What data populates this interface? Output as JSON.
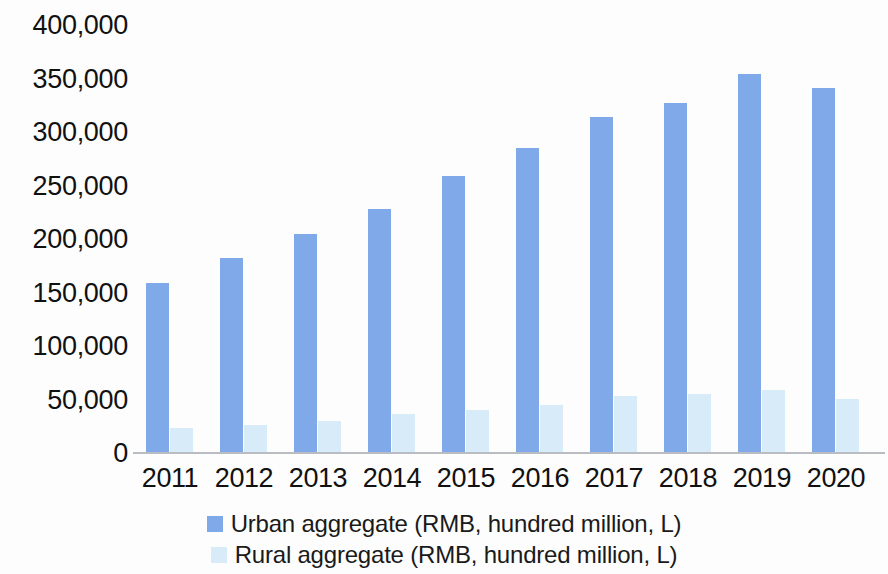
{
  "chart_data": {
    "type": "bar",
    "title": "",
    "subtitle": "",
    "xlabel": "",
    "ylabel": "",
    "categories": [
      "2011",
      "2012",
      "2013",
      "2014",
      "2015",
      "2016",
      "2017",
      "2018",
      "2019",
      "2020"
    ],
    "series": [
      {
        "name": "Urban aggregate (RMB, hundred million, L)",
        "color": "#7fa9e8",
        "values": [
          160000,
          183000,
          206000,
          229000,
          260000,
          286000,
          315000,
          328000,
          355000,
          342000
        ]
      },
      {
        "name": "Rural aggregate (RMB, hundred million, L)",
        "color": "#d8ebf8",
        "values": [
          24000,
          27000,
          31000,
          37000,
          41000,
          46000,
          54000,
          56000,
          60000,
          51000
        ]
      }
    ],
    "ylim": [
      0,
      400000
    ],
    "ytick_labels": [
      "400,000",
      "350,000",
      "300,000",
      "250,000",
      "200,000",
      "150,000",
      "100,000",
      "50,000",
      "0"
    ],
    "ytick_values": [
      400000,
      350000,
      300000,
      250000,
      200000,
      150000,
      100000,
      50000,
      0
    ],
    "grid": false,
    "legend_position": "bottom"
  },
  "legend": {
    "items": [
      {
        "label": "Urban aggregate (RMB, hundred million, L)",
        "swatch": "urban"
      },
      {
        "label": "Rural aggregate (RMB, hundred million, L)",
        "swatch": "rural"
      }
    ]
  },
  "colors": {
    "urban": "#7fa9e8",
    "rural": "#d8ebf8",
    "axis": "#b9bcc0",
    "text": "#111111",
    "background": "#fdfdfd"
  }
}
